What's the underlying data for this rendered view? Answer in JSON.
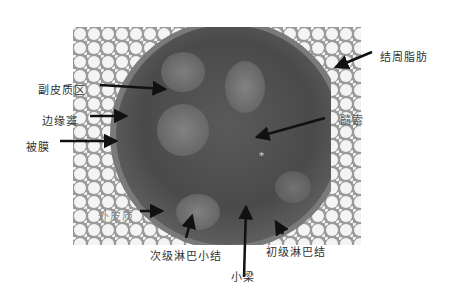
{
  "figure": {
    "labels": {
      "perinodal_fat": "结周脂肪",
      "paracortex": "副皮质区",
      "marginal_sinus": "边缘窦",
      "capsule": "被膜",
      "medullary_cord": "髓索",
      "outer_cortex": "外皮质",
      "secondary_follicle": "次级淋巴小结",
      "trabecula": "小梁",
      "primary_follicle": "初级淋巴结"
    },
    "marker": "*",
    "colors": {
      "background": "#ffffff",
      "fat": "#f2f2f2",
      "tissue_dark": "#4a4a4a",
      "tissue_mid": "#6e6e6e",
      "follicle": "#7c7c7c",
      "arrow": "#111111",
      "label": "#333333"
    }
  }
}
